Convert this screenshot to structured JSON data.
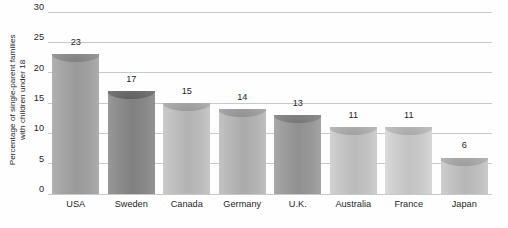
{
  "chart_data": {
    "type": "bar",
    "title": "",
    "subtitle": "",
    "xlabel": "",
    "ylabel": "Percentage of single-parent families with children under 18",
    "ylabel_line1": "Percentage of single-parent families",
    "ylabel_line2": "with children under 18",
    "categories": [
      "USA",
      "Sweden",
      "Canada",
      "Germany",
      "U.K.",
      "Australia",
      "France",
      "Japan"
    ],
    "values": [
      23,
      17,
      15,
      14,
      13,
      11,
      11,
      6
    ],
    "value_labels": [
      "23",
      "17",
      "15",
      "14",
      "13",
      "11",
      "11",
      "6"
    ],
    "ylim": [
      0,
      30
    ],
    "ytick_values": [
      0,
      5,
      10,
      15,
      20,
      25,
      30
    ],
    "ytick_labels": [
      "0",
      "5",
      "10",
      "15",
      "20",
      "25",
      "30"
    ],
    "grid": true,
    "grid_axis": "y",
    "legend": false,
    "legend_position": "none",
    "bar_colors": [
      "#a3a3a3",
      "#8a8a8a",
      "#bdbdbd",
      "#b5b5b5",
      "#9a9a9a",
      "#c4c4c4",
      "#cccccc",
      "#c0c0c0"
    ],
    "bar_cap_colors": [
      "#8f8f8f",
      "#6f6f6f",
      "#a8a8a8",
      "#a0a0a0",
      "#858585",
      "#b0b0b0",
      "#b8b8b8",
      "#ababab"
    ],
    "grid_color": "#c9c9c9",
    "background_color": "#fefefe",
    "text_color": "#1f1f1f"
  }
}
